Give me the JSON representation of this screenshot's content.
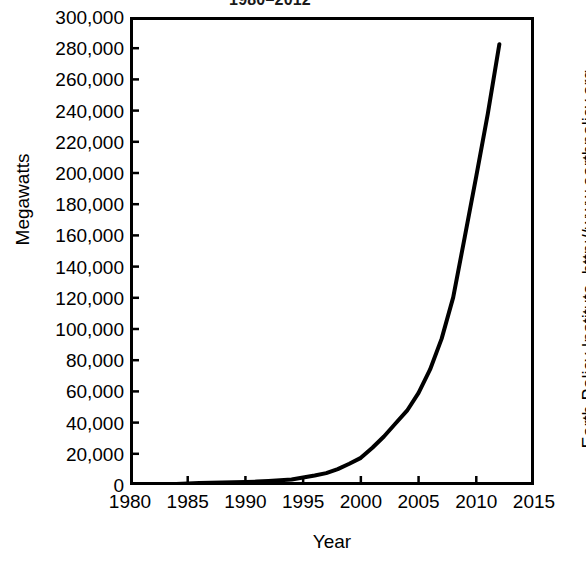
{
  "chart_data": {
    "type": "line",
    "title": "1980–2012",
    "xlabel": "Year",
    "ylabel": "Megawatts",
    "xlim": [
      1980,
      2015
    ],
    "ylim": [
      0,
      300000
    ],
    "grid": false,
    "legend": null,
    "source_credit": "Earth Policy Institute–http://www.earthpolicy.org",
    "x_ticks": [
      "1980",
      "1985",
      "1990",
      "1995",
      "2000",
      "2005",
      "2010",
      "2015"
    ],
    "x_tick_values": [
      1980,
      1985,
      1990,
      1995,
      2000,
      2005,
      2010,
      2015
    ],
    "y_ticks": [
      "0",
      "20,000",
      "40,000",
      "60,000",
      "80,000",
      "100,000",
      "120,000",
      "140,000",
      "160,000",
      "180,000",
      "200,000",
      "220,000",
      "240,000",
      "260,000",
      "280,000",
      "300,000"
    ],
    "y_tick_values": [
      0,
      20000,
      40000,
      60000,
      80000,
      100000,
      120000,
      140000,
      160000,
      180000,
      200000,
      220000,
      240000,
      260000,
      280000,
      300000
    ],
    "line_color": "#000000",
    "line_width": 4,
    "x": [
      1980,
      1981,
      1982,
      1983,
      1984,
      1985,
      1986,
      1987,
      1988,
      1989,
      1990,
      1991,
      1992,
      1993,
      1994,
      1995,
      1996,
      1997,
      1998,
      1999,
      2000,
      2001,
      2002,
      2003,
      2004,
      2005,
      2006,
      2007,
      2008,
      2009,
      2010,
      2011,
      2012
    ],
    "values": [
      10,
      25,
      90,
      210,
      600,
      1020,
      1270,
      1450,
      1580,
      1730,
      1930,
      2170,
      2510,
      2990,
      3490,
      4780,
      6100,
      7600,
      10200,
      13600,
      17400,
      23900,
      31100,
      39431,
      47620,
      59091,
      74052,
      93820,
      120291,
      158864,
      197956,
      238110,
      282587
    ],
    "series_name": "World Wind Electricity-Generating Capacity"
  }
}
